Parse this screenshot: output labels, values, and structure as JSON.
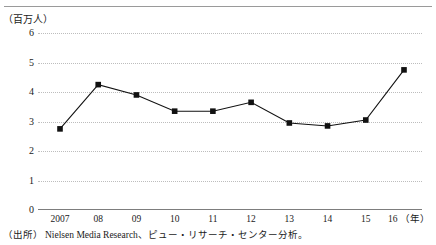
{
  "figure": {
    "y_unit_label": "（百万人）",
    "source_label": "（出所）",
    "source_text": "Nielsen Media Research、ピュー・リサーチ・センター分析。",
    "x_unit_suffix": "（年）"
  },
  "chart_data": {
    "type": "line",
    "title": "",
    "subtitle": "",
    "xlabel": "（年）",
    "ylabel": "（百万人）",
    "categories": [
      "2007",
      "08",
      "09",
      "10",
      "11",
      "12",
      "13",
      "14",
      "15",
      "16"
    ],
    "values": [
      2.75,
      4.25,
      3.9,
      3.35,
      3.35,
      3.65,
      2.95,
      2.85,
      3.05,
      4.75
    ],
    "ylim": [
      0,
      6
    ],
    "yticks": [
      "0",
      "1",
      "2",
      "3",
      "4",
      "5",
      "6"
    ],
    "ytick_values": [
      0,
      1,
      2,
      3,
      4,
      5,
      6
    ],
    "grid": true,
    "grid_style": "dotted-horizontal",
    "legend": "none",
    "marker": "square",
    "line_color": "#111111",
    "marker_color": "#111111",
    "grid_color": "#bdbdbd",
    "axis_color": "#7d7d7d"
  }
}
